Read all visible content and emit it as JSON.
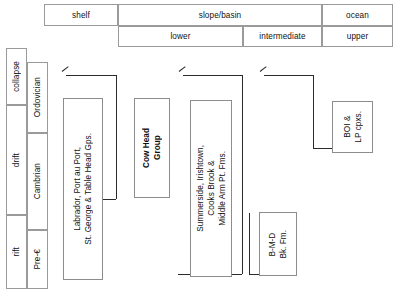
{
  "figure": {
    "type": "stratigraphic-correlation-chart",
    "title": ""
  },
  "header": {
    "row1": [
      {
        "label": "shelf",
        "x": 44,
        "width": 74
      },
      {
        "label": "slope/basin",
        "x": 118,
        "width": 204
      },
      {
        "label": "ocean",
        "x": 322,
        "width": 71
      }
    ],
    "row2": [
      {
        "label": "lower",
        "x": 118,
        "width": 125
      },
      {
        "label": "intermediate",
        "x": 243,
        "width": 79
      },
      {
        "label": "upper",
        "x": 322,
        "width": 71
      }
    ]
  },
  "left_axis": {
    "tectonic": [
      {
        "label": "collapse",
        "y": 48,
        "height": 57
      },
      {
        "label": "drift",
        "y": 105,
        "height": 110
      },
      {
        "label": "rift",
        "y": 215,
        "height": 74
      }
    ],
    "age": [
      {
        "label": "Ordovician",
        "y": 62,
        "height": 71
      },
      {
        "label": "Cambrian",
        "y": 133,
        "height": 97
      },
      {
        "label": "Pre-€",
        "y": 230,
        "height": 59
      }
    ]
  },
  "units": [
    {
      "name": "shelf-succession",
      "text": "Labrador, Port au Port,\nSt. George & Table Head Gps.",
      "bold": false,
      "x": 63,
      "y": 98,
      "width": 40,
      "height": 182
    },
    {
      "name": "cow-head-group",
      "text": "Cow Head\nGroup",
      "bold": true,
      "x": 134,
      "y": 98,
      "width": 36,
      "height": 100
    },
    {
      "name": "lower-slope-formations",
      "text": "Summerside, Irishtown,\nCooks Brook &\nMiddle Arm Pt. Fms.",
      "bold": false,
      "x": 190,
      "y": 100,
      "width": 42,
      "height": 177
    },
    {
      "name": "bmd-black-formation",
      "text": "B-M-D\nBk. Fm.",
      "bold": false,
      "x": 259,
      "y": 212,
      "width": 38,
      "height": 64
    },
    {
      "name": "ophiolite-complexes",
      "text": "BOI &\nLP cpxs.",
      "bold": false,
      "x": 332,
      "y": 101,
      "width": 41,
      "height": 52
    }
  ],
  "connectors": [
    {
      "name": "shelf-connector",
      "arrow_x": 62,
      "arrow_y": 68,
      "top_y": 72,
      "right_x": 116,
      "bottom_y": 199,
      "end_x": 75
    },
    {
      "name": "slope-connector",
      "arrow_x": 179,
      "arrow_y": 68,
      "top_y": 72,
      "right_x": 242,
      "bottom_y": 274,
      "end_x": 178
    },
    {
      "name": "ocean-connector",
      "arrow_x": 260,
      "arrow_y": 68,
      "top_y": 72,
      "right_x": 313,
      "bottom_y": 274,
      "end_x": 258
    },
    {
      "name": "ophiolite-connector",
      "arrow_x": 0,
      "arrow_y": 0,
      "top_y": 0,
      "right_x": 0,
      "bottom_y": 148,
      "end_x": 0
    }
  ],
  "colors": {
    "line": "#2b2b2b",
    "grid": "#9a9a9a",
    "box_border": "#8d8d8d",
    "background": "#ffffff",
    "text": "#111111"
  }
}
